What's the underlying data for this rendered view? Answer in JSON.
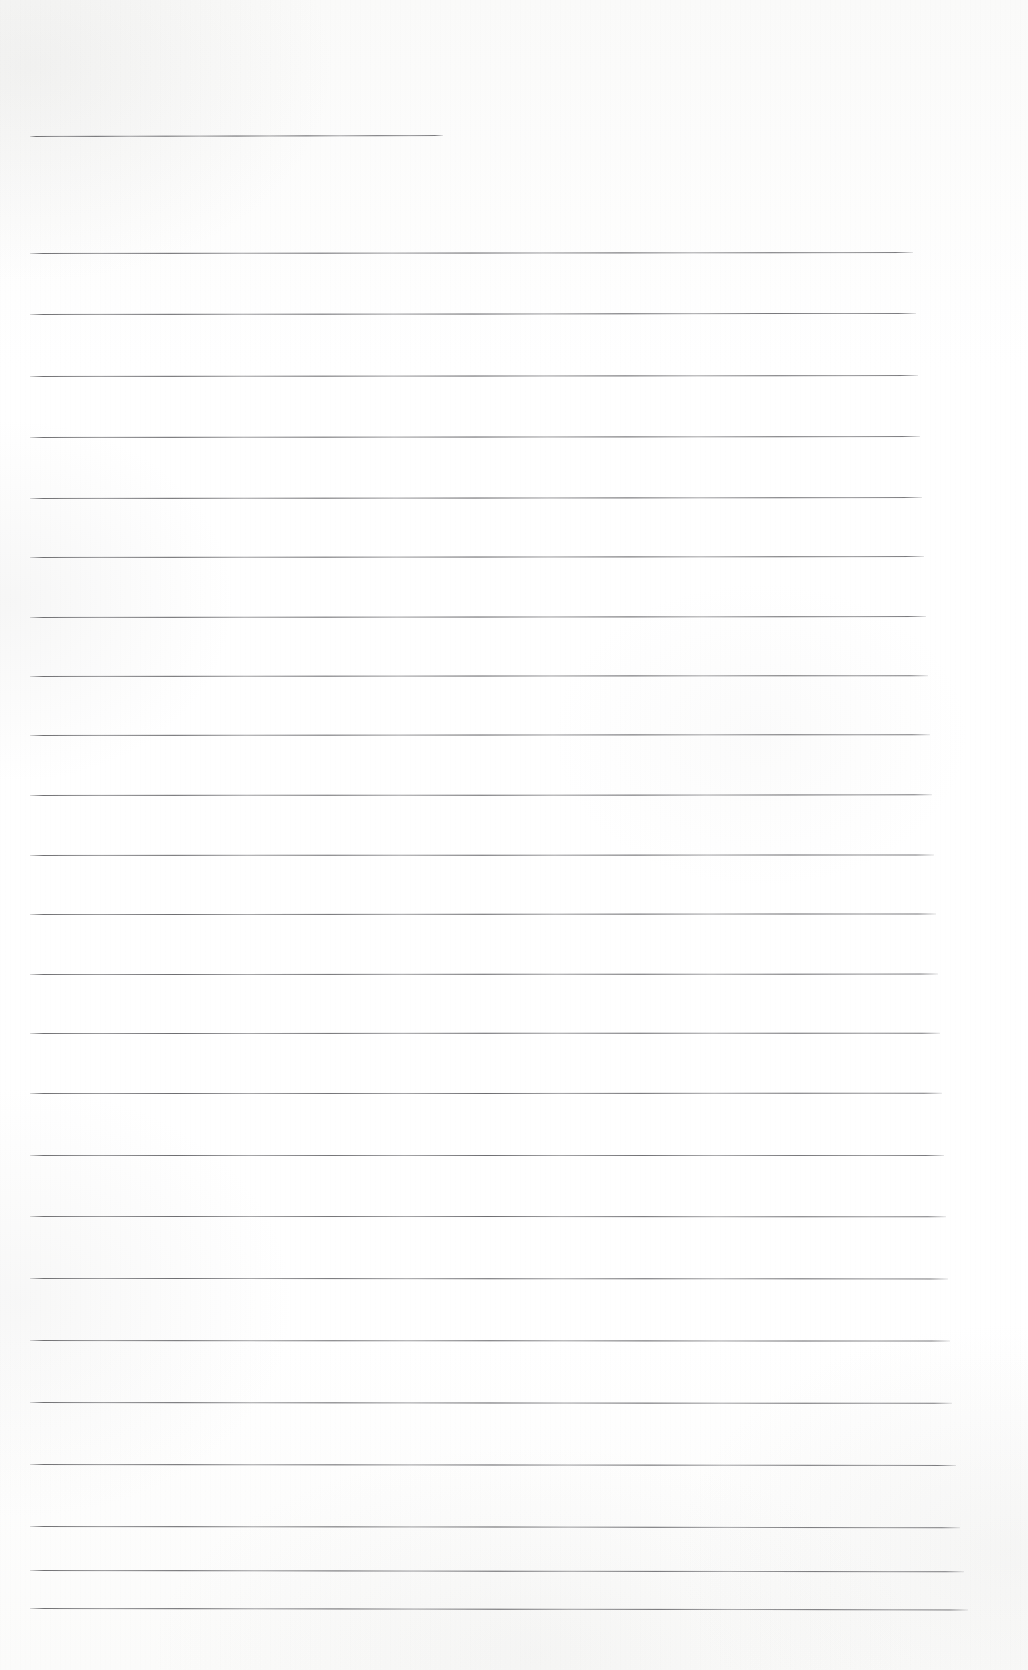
{
  "document": {
    "kind": "scanned-lined-paper",
    "title": "Blank ruled notebook page (scan)",
    "page_width": 1028,
    "page_height": 1670,
    "background_color": "#fdfdfc",
    "rule_color": "#5e5e62",
    "content_text": "",
    "note": "The page is blank — no handwriting, print, headings, page numbers or marginalia are visible. Only horizontal ruling lines on off-white scanned paper."
  },
  "ruling": {
    "left_margin_x": 30,
    "right_margin_x": 968,
    "line_spacing": 61.5,
    "stroke_thickness": 1,
    "first_line_is_short": true,
    "line_count": 25,
    "lines": [
      {
        "index": 1,
        "y": 136,
        "x1": 30,
        "x2": 443,
        "tilt": -0.9,
        "short": true
      },
      {
        "index": 2,
        "y": 253,
        "x1": 30,
        "x2": 913,
        "tilt": -1.0,
        "short": false
      },
      {
        "index": 3,
        "y": 314,
        "x1": 30,
        "x2": 916,
        "tilt": -1.1,
        "short": false
      },
      {
        "index": 4,
        "y": 376,
        "x1": 30,
        "x2": 918,
        "tilt": -1.0,
        "short": false
      },
      {
        "index": 5,
        "y": 437,
        "x1": 30,
        "x2": 920,
        "tilt": -1.0,
        "short": false
      },
      {
        "index": 6,
        "y": 498,
        "x1": 30,
        "x2": 922,
        "tilt": -1.0,
        "short": false
      },
      {
        "index": 7,
        "y": 557,
        "x1": 30,
        "x2": 924,
        "tilt": -0.9,
        "short": false
      },
      {
        "index": 8,
        "y": 617,
        "x1": 30,
        "x2": 926,
        "tilt": -0.9,
        "short": false
      },
      {
        "index": 9,
        "y": 676,
        "x1": 30,
        "x2": 928,
        "tilt": -0.8,
        "short": false
      },
      {
        "index": 10,
        "y": 735,
        "x1": 30,
        "x2": 930,
        "tilt": -0.8,
        "short": false
      },
      {
        "index": 11,
        "y": 795,
        "x1": 30,
        "x2": 932,
        "tilt": -0.7,
        "short": false
      },
      {
        "index": 12,
        "y": 855,
        "x1": 30,
        "x2": 934,
        "tilt": -0.6,
        "short": false
      },
      {
        "index": 13,
        "y": 914,
        "x1": 30,
        "x2": 936,
        "tilt": -0.5,
        "short": false
      },
      {
        "index": 14,
        "y": 974,
        "x1": 30,
        "x2": 938,
        "tilt": -0.4,
        "short": false
      },
      {
        "index": 15,
        "y": 1033,
        "x1": 30,
        "x2": 940,
        "tilt": -0.3,
        "short": false
      },
      {
        "index": 16,
        "y": 1093,
        "x1": 30,
        "x2": 942,
        "tilt": -0.2,
        "short": false
      },
      {
        "index": 17,
        "y": 1155,
        "x1": 30,
        "x2": 944,
        "tilt": 0.0,
        "short": false
      },
      {
        "index": 18,
        "y": 1216,
        "x1": 30,
        "x2": 946,
        "tilt": 0.2,
        "short": false
      },
      {
        "index": 19,
        "y": 1278,
        "x1": 30,
        "x2": 948,
        "tilt": 0.4,
        "short": false
      },
      {
        "index": 20,
        "y": 1340,
        "x1": 30,
        "x2": 950,
        "tilt": 0.6,
        "short": false
      },
      {
        "index": 21,
        "y": 1402,
        "x1": 30,
        "x2": 952,
        "tilt": 0.8,
        "short": false
      },
      {
        "index": 22,
        "y": 1464,
        "x1": 30,
        "x2": 956,
        "tilt": 1.0,
        "short": false
      },
      {
        "index": 23,
        "y": 1526,
        "x1": 30,
        "x2": 960,
        "tilt": 1.2,
        "short": false
      },
      {
        "index": 24,
        "y": 1570,
        "x1": 30,
        "x2": 964,
        "tilt": 1.3,
        "short": false
      },
      {
        "index": 25,
        "y": 1608,
        "x1": 30,
        "x2": 968,
        "tilt": 1.4,
        "short": false
      }
    ]
  }
}
